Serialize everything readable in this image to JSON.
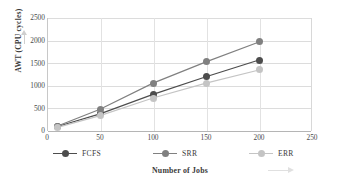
{
  "chart_data": {
    "type": "line",
    "title": "",
    "xlabel": "Number of Jobs",
    "ylabel": "AWT (CPU cycles)",
    "x": [
      10,
      50,
      100,
      150,
      200
    ],
    "xlim": [
      0,
      250
    ],
    "ylim": [
      0,
      2500
    ],
    "xticks": [
      "0",
      "50",
      "100",
      "150",
      "200",
      "250"
    ],
    "yticks": [
      "0",
      "500",
      "1000",
      "1500",
      "2000",
      "2500"
    ],
    "grid": "horizontal-and-vertical",
    "legend_position": "bottom",
    "series": [
      {
        "name": "FCFS",
        "color": "#4d4d4d",
        "values": [
          100,
          380,
          810,
          1200,
          1570
        ]
      },
      {
        "name": "SRR",
        "color": "#808080",
        "values": [
          110,
          480,
          1060,
          1530,
          1970
        ]
      },
      {
        "name": "ERR",
        "color": "#c4c4c4",
        "values": [
          80,
          340,
          730,
          1060,
          1350
        ]
      }
    ]
  },
  "axes": {
    "y_title": "AWT (CPU cycles)",
    "x_title": "Number of Jobs",
    "y_tick_labels": [
      "2500",
      "2000",
      "1500",
      "1000",
      "500",
      "0"
    ],
    "x_tick_labels": [
      "0",
      "50",
      "100",
      "150",
      "200",
      "250"
    ]
  },
  "legend": {
    "items": [
      {
        "label": "FCFS",
        "color": "#4d4d4d"
      },
      {
        "label": "SRR",
        "color": "#808080"
      },
      {
        "label": "ERR",
        "color": "#c4c4c4"
      }
    ]
  },
  "colors": {
    "fcfs": "#4d4d4d",
    "srr": "#808080",
    "err": "#c4c4c4",
    "grid": "#dcdcdc",
    "axis": "#b5b5b5",
    "text": "#3a3a3a",
    "background": "#ffffff"
  }
}
